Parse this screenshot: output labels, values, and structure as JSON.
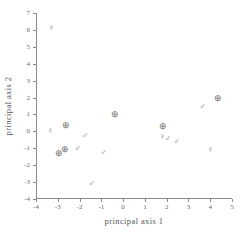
{
  "chart_data": {
    "type": "scatter",
    "title": "",
    "xlabel": "principal axis 1",
    "ylabel": "principal axis 2",
    "xlim": [
      -4,
      5
    ],
    "ylim": [
      -4,
      7
    ],
    "xticks": [
      "-4",
      "-3",
      "-2",
      "-1",
      "0",
      "1",
      "2",
      "3",
      "4",
      "5"
    ],
    "xtick_values": [
      -4,
      -3,
      -2,
      -1,
      0,
      1,
      2,
      3,
      4,
      5
    ],
    "yticks": [
      "-4",
      "-3",
      "-2",
      "-1",
      "0",
      "1",
      "2",
      "3",
      "4",
      "5",
      "6",
      "7"
    ],
    "ytick_values": [
      -4,
      -3,
      -2,
      -1,
      0,
      1,
      2,
      3,
      4,
      5,
      6,
      7
    ],
    "grid": false,
    "legend": "none",
    "marker_color": "#6e6e6e",
    "axis_color": "#8a8a8a",
    "series": [
      {
        "name": "female",
        "symbol": "♀",
        "marker_name": "venus-symbol",
        "points": [
          {
            "x": -3.3,
            "y": 6.1
          },
          {
            "x": -3.35,
            "y": 0.0
          },
          {
            "x": 1.8,
            "y": -0.35
          },
          {
            "x": 4.0,
            "y": -1.1
          }
        ]
      },
      {
        "name": "male",
        "symbol": "♂",
        "marker_name": "mars-symbol",
        "points": [
          {
            "x": -1.75,
            "y": -0.25
          },
          {
            "x": -2.1,
            "y": -1.05
          },
          {
            "x": -0.9,
            "y": -1.25
          },
          {
            "x": -1.45,
            "y": -3.1
          },
          {
            "x": 2.05,
            "y": -0.45
          },
          {
            "x": 2.45,
            "y": -0.6
          },
          {
            "x": 3.65,
            "y": 1.45
          }
        ]
      },
      {
        "name": "circled",
        "symbol": "⊕",
        "marker_name": "circled-cross-symbol",
        "points": [
          {
            "x": -2.6,
            "y": 0.4
          },
          {
            "x": -2.95,
            "y": -1.3
          },
          {
            "x": -2.65,
            "y": -1.05
          },
          {
            "x": -0.35,
            "y": 1.0
          },
          {
            "x": 1.85,
            "y": 0.3
          },
          {
            "x": 4.35,
            "y": 2.0
          }
        ]
      }
    ]
  }
}
